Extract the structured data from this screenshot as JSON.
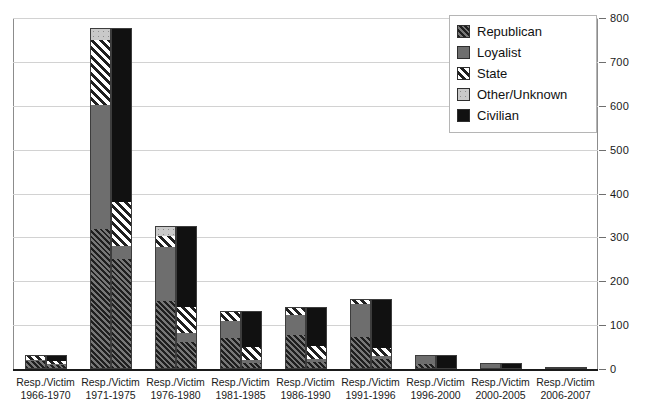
{
  "chart_data": {
    "type": "bar",
    "subtype": "stacked-grouped",
    "title": "",
    "xlabel": "",
    "ylabel": "",
    "ylim": [
      0,
      800
    ],
    "ytick_step": 100,
    "yticks": [
      0,
      100,
      200,
      300,
      400,
      500,
      600,
      700,
      800
    ],
    "ytick_labels": [
      "0",
      "100",
      "200",
      "300",
      "400",
      "500",
      "600",
      "700",
      "800"
    ],
    "grid": true,
    "legend_position": "top-right",
    "categories": [
      "1966-1970",
      "1971-1975",
      "1976-1980",
      "1981-1985",
      "1986-1990",
      "1991-1996",
      "1996-2000",
      "2000-2005",
      "2006-2007"
    ],
    "category_prefix": "Resp./Victim",
    "subgroups": [
      "Responsible",
      "Victim"
    ],
    "stack_order": [
      "Republican",
      "Loyalist",
      "State",
      "Other/Unknown",
      "Civilian"
    ],
    "legend": [
      {
        "label": "Republican",
        "pattern": "diagonal-hatch-dark",
        "color": "#4a4a4a"
      },
      {
        "label": "Loyalist",
        "pattern": "solid",
        "color": "#6e6e6e"
      },
      {
        "label": "State",
        "pattern": "diagonal-hatch-white",
        "color": "#ffffff"
      },
      {
        "label": "Other/Unknown",
        "pattern": "dotted-light",
        "color": "#c9c9c9"
      },
      {
        "label": "Civilian",
        "pattern": "solid",
        "color": "#111111"
      }
    ],
    "series": [
      {
        "name": "Responsible",
        "stacks": [
          {
            "category": "1966-1970",
            "Republican": 18,
            "Loyalist": 4,
            "State": 10,
            "Other/Unknown": 0,
            "Civilian": 0,
            "total": 32
          },
          {
            "category": "1971-1975",
            "Republican": 318,
            "Loyalist": 285,
            "State": 150,
            "Other/Unknown": 25,
            "Civilian": 0,
            "total": 778
          },
          {
            "category": "1976-1980",
            "Republican": 155,
            "Loyalist": 125,
            "State": 25,
            "Other/Unknown": 20,
            "Civilian": 0,
            "total": 325
          },
          {
            "category": "1981-1985",
            "Republican": 72,
            "Loyalist": 40,
            "State": 20,
            "Other/Unknown": 0,
            "Civilian": 0,
            "total": 132
          },
          {
            "category": "1986-1990",
            "Republican": 78,
            "Loyalist": 48,
            "State": 16,
            "Other/Unknown": 0,
            "Civilian": 0,
            "total": 142
          },
          {
            "category": "1991-1996",
            "Republican": 72,
            "Loyalist": 78,
            "State": 10,
            "Other/Unknown": 0,
            "Civilian": 0,
            "total": 160
          },
          {
            "category": "1996-2000",
            "Republican": 10,
            "Loyalist": 22,
            "State": 0,
            "Other/Unknown": 0,
            "Civilian": 0,
            "total": 32
          },
          {
            "category": "2000-2005",
            "Republican": 0,
            "Loyalist": 14,
            "State": 0,
            "Other/Unknown": 0,
            "Civilian": 0,
            "total": 14
          },
          {
            "category": "2006-2007",
            "Republican": 0,
            "Loyalist": 2,
            "State": 0,
            "Other/Unknown": 0,
            "Civilian": 0,
            "total": 2
          }
        ]
      },
      {
        "name": "Victim",
        "stacks": [
          {
            "category": "1966-1970",
            "Republican": 8,
            "Loyalist": 4,
            "State": 6,
            "Other/Unknown": 0,
            "Civilian": 14,
            "total": 32
          },
          {
            "category": "1971-1975",
            "Republican": 250,
            "Loyalist": 30,
            "State": 100,
            "Other/Unknown": 0,
            "Civilian": 398,
            "total": 778
          },
          {
            "category": "1976-1980",
            "Republican": 60,
            "Loyalist": 20,
            "State": 60,
            "Other/Unknown": 0,
            "Civilian": 185,
            "total": 325
          },
          {
            "category": "1981-1985",
            "Republican": 12,
            "Loyalist": 6,
            "State": 32,
            "Other/Unknown": 0,
            "Civilian": 82,
            "total": 132
          },
          {
            "category": "1986-1990",
            "Republican": 14,
            "Loyalist": 8,
            "State": 30,
            "Other/Unknown": 0,
            "Civilian": 90,
            "total": 142
          },
          {
            "category": "1991-1996",
            "Republican": 22,
            "Loyalist": 6,
            "State": 18,
            "Other/Unknown": 0,
            "Civilian": 114,
            "total": 160
          },
          {
            "category": "1996-2000",
            "Republican": 0,
            "Loyalist": 0,
            "State": 0,
            "Other/Unknown": 0,
            "Civilian": 32,
            "total": 32
          },
          {
            "category": "2000-2005",
            "Republican": 0,
            "Loyalist": 0,
            "State": 0,
            "Other/Unknown": 0,
            "Civilian": 14,
            "total": 14
          },
          {
            "category": "2006-2007",
            "Republican": 0,
            "Loyalist": 0,
            "State": 0,
            "Other/Unknown": 0,
            "Civilian": 2,
            "total": 2
          }
        ]
      }
    ]
  }
}
